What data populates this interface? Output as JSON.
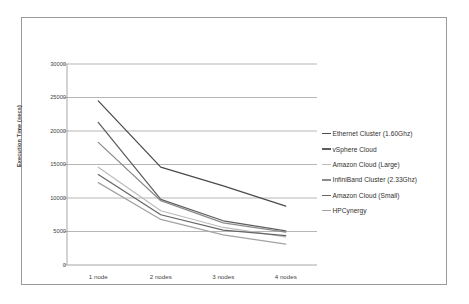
{
  "figure": {
    "border_color": "#9a9a9a",
    "background": "#ffffff"
  },
  "chart_data": {
    "type": "line",
    "title": "",
    "xlabel": "",
    "ylabel": "Execution Time (secs)",
    "categories": [
      "1 node",
      "2 nodes",
      "3 nodes",
      "4 nodes"
    ],
    "ylim": [
      0,
      30000
    ],
    "yticks": [
      0,
      5000,
      10000,
      15000,
      20000,
      25000,
      30000
    ],
    "ytick_labels": [
      "0",
      "5000",
      "10000",
      "15000",
      "20000",
      "25000",
      "30000"
    ],
    "grid": true,
    "grid_axis": "y",
    "legend_position": "right",
    "series": [
      {
        "name": "Ethernet Cluster (1.60Ghz)",
        "color": "#4a4a4a",
        "values": [
          24500,
          14600,
          11800,
          8800
        ]
      },
      {
        "name": "vSphere Cloud",
        "color": "#5d5d5d",
        "values": [
          21300,
          9800,
          6600,
          5100
        ]
      },
      {
        "name": "Amazon Cloud (Large)",
        "color": "#bcbcbc",
        "values": [
          14600,
          8100,
          5600,
          4200
        ]
      },
      {
        "name": "InfiniBand Cluster (2.33Ghz)",
        "color": "#8b8b8b",
        "values": [
          18300,
          9600,
          6300,
          4900
        ]
      },
      {
        "name": "Amazon Cloud  (Small)",
        "color": "#666666",
        "values": [
          13500,
          7500,
          5200,
          4400
        ]
      },
      {
        "name": "HPCynergy",
        "color": "#a3a3a3",
        "values": [
          12300,
          6800,
          4500,
          3100
        ]
      }
    ]
  }
}
